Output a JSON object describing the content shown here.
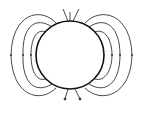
{
  "diagram": {
    "title": "",
    "colors": {
      "background": "#ffffff",
      "sphere_stroke": "#111111",
      "line_stroke": "#333333"
    },
    "sphere": {
      "cx": 70,
      "cy": 55,
      "r": 34
    },
    "field_lines_left": 3,
    "field_lines_right": 3,
    "pole_lines_top": 3,
    "pole_lines_bottom": 3
  }
}
